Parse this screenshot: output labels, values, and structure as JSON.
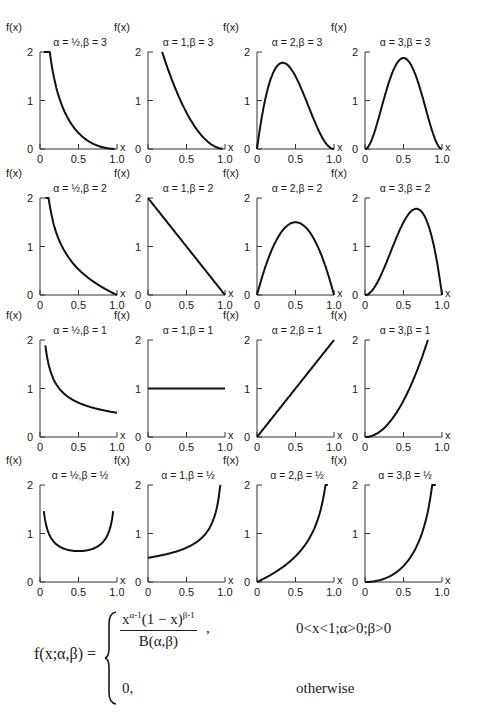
{
  "chart_data": {
    "type": "line",
    "layout": {
      "rows": 4,
      "cols": 4,
      "grid": false,
      "legend": "none"
    },
    "xlabel": "x",
    "ylabel": "f(x)",
    "xlim": [
      0,
      1.0
    ],
    "ylim": [
      0,
      2
    ],
    "xticks": [
      "0",
      "0.5",
      "1.0"
    ],
    "yticks": [
      "0",
      "1",
      "2"
    ],
    "panels": [
      {
        "title": "α = ½,β = 3",
        "alpha": 0.5,
        "beta": 3,
        "x": [
          0.05,
          0.1,
          0.2,
          0.3,
          0.4,
          0.5,
          0.6,
          0.7,
          0.8,
          0.9,
          0.97
        ],
        "y": [
          2.0,
          1.55,
          0.99,
          0.65,
          0.42,
          0.26,
          0.15,
          0.08,
          0.03,
          0.01,
          0.0
        ]
      },
      {
        "title": "α = 1,β = 3",
        "alpha": 1,
        "beta": 3,
        "x": [
          0.18,
          0.3,
          0.4,
          0.5,
          0.6,
          0.7,
          0.8,
          0.9,
          0.97
        ],
        "y": [
          2.0,
          1.47,
          1.08,
          0.75,
          0.48,
          0.27,
          0.12,
          0.03,
          0.0
        ]
      },
      {
        "title": "α = 2,β = 3",
        "alpha": 2,
        "beta": 3,
        "x": [
          0,
          0.1,
          0.2,
          0.333,
          0.4,
          0.5,
          0.6,
          0.7,
          0.8,
          0.9,
          1.0
        ],
        "y": [
          0,
          0.97,
          1.54,
          1.78,
          1.73,
          1.5,
          1.15,
          0.76,
          0.38,
          0.11,
          0
        ]
      },
      {
        "title": "α = 3,β = 3",
        "alpha": 3,
        "beta": 3,
        "x": [
          0,
          0.1,
          0.2,
          0.3,
          0.4,
          0.5,
          0.6,
          0.7,
          0.8,
          0.9,
          1.0
        ],
        "y": [
          0,
          0.24,
          0.77,
          1.32,
          1.73,
          1.88,
          1.73,
          1.32,
          0.77,
          0.24,
          0
        ]
      },
      {
        "title": "α = ½,β = 2",
        "alpha": 0.5,
        "beta": 2,
        "x": [
          0.07,
          0.1,
          0.2,
          0.3,
          0.4,
          0.5,
          0.6,
          0.7,
          0.8,
          0.9,
          1.0
        ],
        "y": [
          1.9,
          1.42,
          0.89,
          0.64,
          0.47,
          0.35,
          0.26,
          0.18,
          0.11,
          0.05,
          0
        ]
      },
      {
        "title": "α = 1,β = 2",
        "alpha": 1,
        "beta": 2,
        "x": [
          0,
          0.5,
          1.0
        ],
        "y": [
          2,
          1,
          0
        ]
      },
      {
        "title": "α = 2,β = 2",
        "alpha": 2,
        "beta": 2,
        "x": [
          0,
          0.1,
          0.2,
          0.3,
          0.4,
          0.5,
          0.6,
          0.7,
          0.8,
          0.9,
          1.0
        ],
        "y": [
          0,
          0.54,
          0.96,
          1.26,
          1.44,
          1.5,
          1.44,
          1.26,
          0.96,
          0.54,
          0
        ]
      },
      {
        "title": "α = 3,β = 2",
        "alpha": 3,
        "beta": 2,
        "x": [
          0,
          0.1,
          0.2,
          0.3,
          0.4,
          0.5,
          0.6,
          0.667,
          0.7,
          0.8,
          0.9,
          1.0
        ],
        "y": [
          0,
          0.11,
          0.38,
          0.76,
          1.15,
          1.5,
          1.73,
          1.78,
          1.76,
          1.54,
          0.97,
          0
        ]
      },
      {
        "title": "α = ½,β = 1",
        "alpha": 0.5,
        "beta": 1,
        "x": [
          0.07,
          0.1,
          0.2,
          0.3,
          0.4,
          0.5,
          0.6,
          0.7,
          0.8,
          0.9,
          1.0
        ],
        "y": [
          1.89,
          1.58,
          1.12,
          0.91,
          0.79,
          0.71,
          0.65,
          0.6,
          0.56,
          0.53,
          0.5
        ]
      },
      {
        "title": "α = 1,β = 1",
        "alpha": 1,
        "beta": 1,
        "x": [
          0,
          1.0
        ],
        "y": [
          1,
          1
        ]
      },
      {
        "title": "α = 2,β = 1",
        "alpha": 2,
        "beta": 1,
        "x": [
          0,
          1.0
        ],
        "y": [
          0,
          2
        ]
      },
      {
        "title": "α = 3,β = 1",
        "alpha": 3,
        "beta": 1,
        "x": [
          0,
          0.1,
          0.2,
          0.3,
          0.4,
          0.5,
          0.6,
          0.7,
          0.8,
          0.82
        ],
        "y": [
          0,
          0.03,
          0.12,
          0.27,
          0.48,
          0.75,
          1.08,
          1.47,
          1.92,
          2.0
        ]
      },
      {
        "title": "α = ½,β = ½",
        "alpha": 0.5,
        "beta": 0.5,
        "x": [
          0.05,
          0.1,
          0.2,
          0.3,
          0.4,
          0.5,
          0.6,
          0.7,
          0.8,
          0.9,
          0.95
        ],
        "y": [
          1.46,
          1.06,
          0.8,
          0.69,
          0.65,
          0.64,
          0.65,
          0.69,
          0.8,
          1.06,
          1.46
        ]
      },
      {
        "title": "α = 1,β = ½",
        "alpha": 1,
        "beta": 0.5,
        "x": [
          0,
          0.1,
          0.2,
          0.3,
          0.4,
          0.5,
          0.6,
          0.7,
          0.8,
          0.9,
          0.94
        ],
        "y": [
          0.5,
          0.53,
          0.56,
          0.6,
          0.65,
          0.71,
          0.79,
          0.91,
          1.12,
          1.58,
          2.0
        ]
      },
      {
        "title": "α = 2,β = ½",
        "alpha": 2,
        "beta": 0.5,
        "x": [
          0,
          0.1,
          0.2,
          0.3,
          0.4,
          0.5,
          0.6,
          0.7,
          0.8,
          0.9,
          0.92
        ],
        "y": [
          0,
          0.08,
          0.17,
          0.27,
          0.39,
          0.53,
          0.71,
          0.96,
          1.34,
          2.01,
          2.0
        ]
      },
      {
        "title": "α = 3,β = ½",
        "alpha": 3,
        "beta": 0.5,
        "x": [
          0,
          0.1,
          0.2,
          0.3,
          0.4,
          0.5,
          0.6,
          0.7,
          0.8,
          0.9,
          0.92
        ],
        "y": [
          0,
          0.01,
          0.05,
          0.12,
          0.24,
          0.4,
          0.64,
          1.0,
          1.6,
          2.0,
          2.0
        ]
      }
    ]
  },
  "formula": {
    "lhs": "f(x;α,β) =",
    "numerator_base": "x",
    "numerator_exp1": "α-1",
    "numerator_mid": "(1 − x)",
    "numerator_exp2": "β-1",
    "denominator": "B(α,β)",
    "comma": ",",
    "condition1": "0<x<1;α>0;β>0",
    "case2_value": "0,",
    "condition2": "otherwise"
  }
}
